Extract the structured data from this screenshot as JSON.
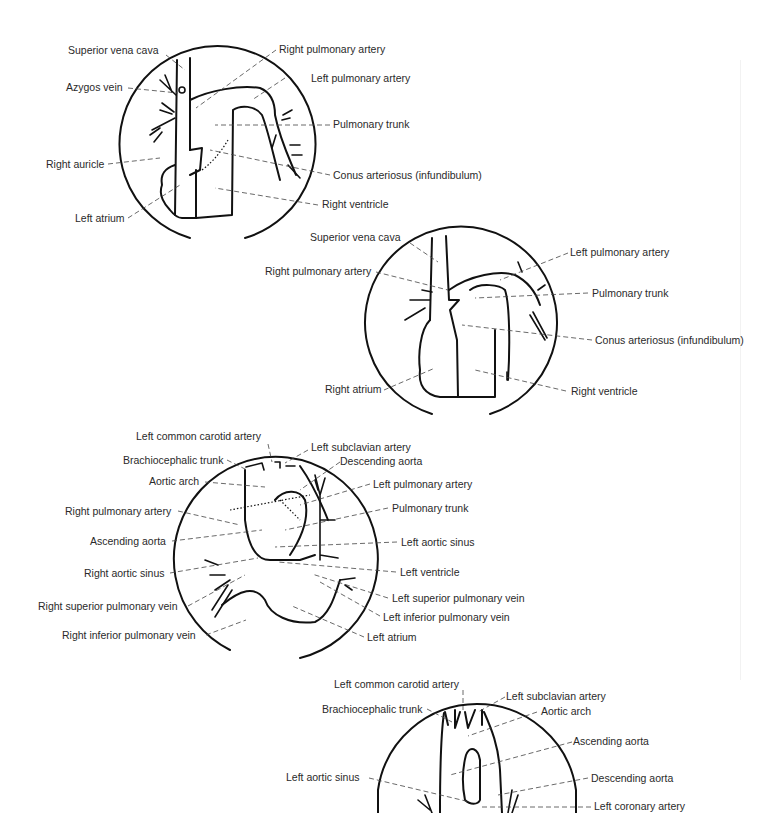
{
  "figures": [
    {
      "id": "fig1",
      "labels": [
        "Superior vena cava",
        "Right pulmonary artery",
        "Azygos vein",
        "Left pulmonary artery",
        "Pulmonary trunk",
        "Right auricle",
        "Conus arteriosus (infundibulum)",
        "Left atrium",
        "Right ventricle"
      ]
    },
    {
      "id": "fig2",
      "labels": [
        "Superior vena cava",
        "Left pulmonary artery",
        "Right pulmonary artery",
        "Pulmonary trunk",
        "Conus arteriosus (infundibulum)",
        "Right atrium",
        "Right ventricle"
      ]
    },
    {
      "id": "fig3",
      "labels": [
        "Left common carotid artery",
        "Left subclavian artery",
        "Brachiocephalic trunk",
        "Descending aorta",
        "Aortic arch",
        "Left pulmonary artery",
        "Right pulmonary artery",
        "Pulmonary trunk",
        "Ascending aorta",
        "Left aortic sinus",
        "Right aortic sinus",
        "Left ventricle",
        "Left superior pulmonary vein",
        "Right superior pulmonary vein",
        "Left inferior pulmonary vein",
        "Right inferior pulmonary vein",
        "Left atrium"
      ]
    },
    {
      "id": "fig4",
      "labels": [
        "Left common carotid artery",
        "Left subclavian artery",
        "Brachiocephalic trunk",
        "Aortic arch",
        "Ascending aorta",
        "Left aortic sinus",
        "Descending aorta",
        "Left coronary artery"
      ]
    }
  ]
}
